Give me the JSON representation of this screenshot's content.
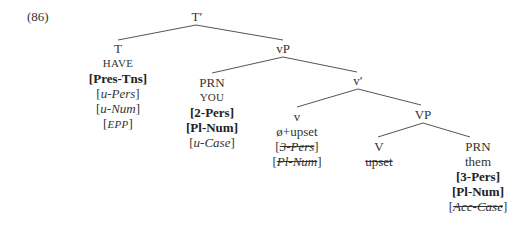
{
  "example_number": "(86)",
  "nodes": {
    "tbar": {
      "label": "T′"
    },
    "t": {
      "label": "T",
      "word": "HAVE",
      "features": [
        "Pres-Tns",
        "u-Pers",
        "u-Num",
        "EPP"
      ]
    },
    "vp_small": {
      "label": "vP"
    },
    "prn1": {
      "label": "PRN",
      "word": "YOU",
      "features": [
        "2-Pers",
        "Pl-Num",
        "u-Case"
      ]
    },
    "vbar": {
      "label": "v′"
    },
    "v": {
      "label": "v",
      "word": "ø+upset",
      "features": [
        "3-Pers",
        "Pl-Num"
      ]
    },
    "VP": {
      "label": "VP"
    },
    "V": {
      "label": "V",
      "word": "upset"
    },
    "prn2": {
      "label": "PRN",
      "word": "them",
      "features": [
        "3-Pers",
        "Pl-Num",
        "Acc-Case"
      ]
    }
  },
  "feature_parts": {
    "t_pres": {
      "bracket_open": "[",
      "text": "Pres-Tns",
      "bracket_close": "]"
    },
    "t_u1": "u",
    "t_pers": "-Pers",
    "t_u2": "u",
    "t_num": "-Num",
    "t_epp": "EPP",
    "prn1_pers": "2-Pers",
    "prn1_num": "Pl-Num",
    "prn1_u": "u",
    "prn1_case": "-Case",
    "v_pers": "3-Pers",
    "v_num": "Pl-Num",
    "prn2_pers": "3-Pers",
    "prn2_num": "Pl-Num",
    "prn2_case": "Acc-Case"
  },
  "brackets": {
    "open": "[",
    "close": "]"
  },
  "colors": {
    "line": "#555555",
    "text": "#333333"
  }
}
